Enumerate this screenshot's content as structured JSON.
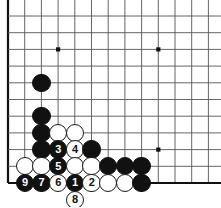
{
  "diagram": {
    "board": {
      "grid_spacing": 16.7,
      "origin_x": 8,
      "origin_y": 16,
      "cols": 13,
      "rows": 11,
      "line_color": "#555555",
      "edge_color": "#111111",
      "background": "#ffffff",
      "star_points": [
        {
          "col": 3,
          "row": 2
        },
        {
          "col": 9,
          "row": 2
        },
        {
          "col": 9,
          "row": 8
        }
      ]
    },
    "stone_colors": {
      "black_fill": "#111111",
      "white_fill": "#ffffff",
      "white_border": "#1a1a1a",
      "black_label": "#ffffff",
      "white_label": "#111111"
    },
    "stone_radius": 9.2,
    "stones": [
      {
        "col": 2,
        "row": 4,
        "color": "black",
        "label": ""
      },
      {
        "col": 2,
        "row": 6,
        "color": "black",
        "label": ""
      },
      {
        "col": 2,
        "row": 7,
        "color": "black",
        "label": ""
      },
      {
        "col": 2,
        "row": 8,
        "color": "black",
        "label": ""
      },
      {
        "col": 3,
        "row": 7,
        "color": "white",
        "label": ""
      },
      {
        "col": 4,
        "row": 7,
        "color": "white",
        "label": ""
      },
      {
        "col": 3,
        "row": 8,
        "color": "black",
        "label": "3"
      },
      {
        "col": 4,
        "row": 8,
        "color": "white",
        "label": "4"
      },
      {
        "col": 5,
        "row": 8,
        "color": "black",
        "label": ""
      },
      {
        "col": 1,
        "row": 9,
        "color": "white",
        "label": ""
      },
      {
        "col": 2,
        "row": 9,
        "color": "white",
        "label": ""
      },
      {
        "col": 3,
        "row": 9,
        "color": "black",
        "label": "5"
      },
      {
        "col": 4,
        "row": 9,
        "color": "white",
        "label": ""
      },
      {
        "col": 5,
        "row": 9,
        "color": "white",
        "label": ""
      },
      {
        "col": 6,
        "row": 9,
        "color": "black",
        "label": ""
      },
      {
        "col": 7,
        "row": 9,
        "color": "black",
        "label": ""
      },
      {
        "col": 8,
        "row": 9,
        "color": "black",
        "label": ""
      },
      {
        "col": 1,
        "row": 10,
        "color": "black",
        "label": "9"
      },
      {
        "col": 2,
        "row": 10,
        "color": "black",
        "label": "7"
      },
      {
        "col": 3,
        "row": 10,
        "color": "white",
        "label": "6"
      },
      {
        "col": 4,
        "row": 10,
        "color": "black",
        "label": "1"
      },
      {
        "col": 5,
        "row": 10,
        "color": "white",
        "label": "2"
      },
      {
        "col": 6,
        "row": 10,
        "color": "white",
        "label": ""
      },
      {
        "col": 7,
        "row": 10,
        "color": "white",
        "label": ""
      },
      {
        "col": 8,
        "row": 10,
        "color": "black",
        "label": ""
      },
      {
        "col": 4,
        "row": 11,
        "color": "white",
        "label": "8"
      }
    ]
  }
}
